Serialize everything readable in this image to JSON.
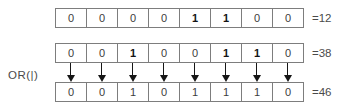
{
  "operation_label": "OR(|)",
  "colors": {
    "background": "#ffffff",
    "cell_border": "#7d7d7d",
    "digit_text": "#3c3c3c",
    "bold_digit_text": "#141414",
    "arrow": "#161616",
    "label_text": "#4a4a4a"
  },
  "rows": [
    {
      "name": "operand-a",
      "bits": [
        "0",
        "0",
        "0",
        "0",
        "1",
        "1",
        "0",
        "0"
      ],
      "bold": [
        false,
        false,
        false,
        false,
        true,
        true,
        false,
        false
      ],
      "result": "=12"
    },
    {
      "name": "operand-b",
      "bits": [
        "0",
        "0",
        "1",
        "0",
        "0",
        "1",
        "1",
        "0"
      ],
      "bold": [
        false,
        false,
        true,
        false,
        false,
        true,
        true,
        false
      ],
      "result": "=38"
    },
    {
      "name": "result",
      "bits": [
        "0",
        "0",
        "1",
        "0",
        "1",
        "1",
        "1",
        "0"
      ],
      "bold": [
        false,
        false,
        false,
        false,
        false,
        false,
        false,
        false
      ],
      "result": "=46"
    }
  ],
  "arrows": {
    "count": 8,
    "direction": "down"
  }
}
